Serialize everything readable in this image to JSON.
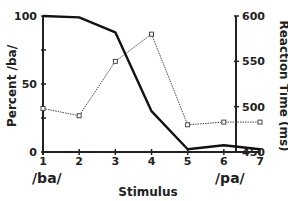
{
  "chart_data": {
    "type": "line",
    "title": "",
    "xlabel": "Stimulus",
    "ylabel_left": "Percent /ba/",
    "ylabel_right": "Reaction Time (ms)",
    "x": [
      1,
      2,
      3,
      4,
      5,
      6,
      7
    ],
    "x_endpoint_labels": {
      "left": "/ba/",
      "right": "/pa/"
    },
    "ylim_left": [
      0,
      100
    ],
    "ylim_right": [
      450,
      600
    ],
    "yticks_left": [
      0,
      50,
      100
    ],
    "yticks_right": [
      450,
      500,
      550,
      600
    ],
    "grid": false,
    "legend": null,
    "series": [
      {
        "name": "Percent /ba/",
        "axis": "left",
        "style": "solid-thick",
        "marker": "none",
        "values": [
          100,
          99,
          88,
          30,
          2,
          5,
          2
        ]
      },
      {
        "name": "Reaction Time (ms)",
        "axis": "right",
        "style": "dotted-thin",
        "marker": "open-square",
        "values": [
          498,
          490,
          550,
          580,
          480,
          483,
          483
        ]
      }
    ]
  },
  "labels": {
    "left_ticks": [
      "0",
      "50",
      "100"
    ],
    "right_ticks": [
      "450",
      "500",
      "550",
      "600"
    ],
    "x_ticks": [
      "1",
      "2",
      "3",
      "4",
      "5",
      "6",
      "7"
    ],
    "xlabel": "Stimulus",
    "ylabel_left": "Percent /ba/",
    "ylabel_right": "Reaction Time (ms)",
    "endpoint_left": "/ba/",
    "endpoint_right": "/pa/"
  }
}
